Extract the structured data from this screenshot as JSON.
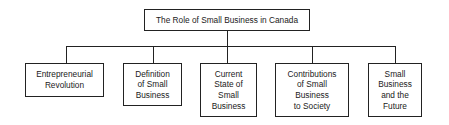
{
  "diagram": {
    "root": {
      "label": "The Role of Small Business in Canada"
    },
    "children": [
      {
        "label": "Entrepreneurial\nRevolution"
      },
      {
        "label": "Definition\nof Small\nBusiness"
      },
      {
        "label": "Current\nState of\nSmall\nBusiness"
      },
      {
        "label": "Contributions\nof Small\nBusiness\nto Society"
      },
      {
        "label": "Small\nBusiness\nand the\nFuture"
      }
    ]
  }
}
